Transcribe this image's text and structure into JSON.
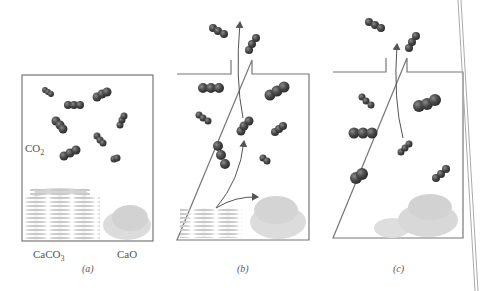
{
  "figure": {
    "panels": [
      {
        "id": "a",
        "caption": "(a)",
        "labels": {
          "gas": "CO",
          "gas_sub": "2",
          "solid_left": "CaCO",
          "solid_left_sub": "3",
          "solid_right": "CaO"
        }
      },
      {
        "id": "b",
        "caption": "(b)"
      },
      {
        "id": "c",
        "caption": "(c)"
      }
    ],
    "colors": {
      "molecule": "#4a4a4a",
      "container": "#777777",
      "arrow": "#555555",
      "solid": "#c8c8c8",
      "text": "#555555"
    }
  }
}
